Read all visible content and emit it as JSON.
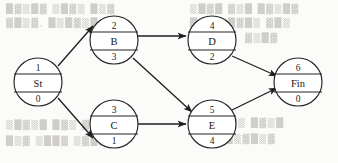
{
  "diagram": {
    "type": "activity-on-node-network",
    "node_fields": {
      "top": "node number",
      "middle": "activity label",
      "bottom": "duration"
    },
    "nodes": [
      {
        "id": "n1",
        "number": "1",
        "label": "St",
        "duration": "0",
        "cx": 38,
        "cy": 82
      },
      {
        "id": "n2",
        "number": "2",
        "label": "B",
        "duration": "3",
        "cx": 114,
        "cy": 40
      },
      {
        "id": "n3",
        "number": "3",
        "label": "C",
        "duration": "1",
        "cx": 114,
        "cy": 124
      },
      {
        "id": "n4",
        "number": "4",
        "label": "D",
        "duration": "2",
        "cx": 212,
        "cy": 40
      },
      {
        "id": "n5",
        "number": "5",
        "label": "E",
        "duration": "4",
        "cx": 212,
        "cy": 124
      },
      {
        "id": "n6",
        "number": "6",
        "label": "Fin",
        "duration": "0",
        "cx": 298,
        "cy": 82
      }
    ],
    "edges": [
      {
        "id": "e1",
        "from": "n1",
        "to": "n2",
        "name": "edge-st-to-b"
      },
      {
        "id": "e2",
        "from": "n1",
        "to": "n3",
        "name": "edge-st-to-c"
      },
      {
        "id": "e3",
        "from": "n2",
        "to": "n4",
        "name": "edge-b-to-d"
      },
      {
        "id": "e4",
        "from": "n2",
        "to": "n5",
        "name": "edge-b-to-e"
      },
      {
        "id": "e5",
        "from": "n3",
        "to": "n5",
        "name": "edge-c-to-e"
      },
      {
        "id": "e6",
        "from": "n4",
        "to": "n6",
        "name": "edge-d-to-fin"
      },
      {
        "id": "e7",
        "from": "n5",
        "to": "n6",
        "name": "edge-e-to-fin"
      }
    ],
    "background_showthrough": [
      "█▓▒█▓ ▒█▓▒ █▒▓",
      "▓█▒▓, █▒█▓▒█ ▒▓",
      "▒█▓█ ▓▒█ █▓▒█▓",
      "█▓▒ ▒█▓█▒ ▓█▒",
      "▓▒█▓",
      "▒█▓▒█ █▓▒ ▓█▒█▓",
      "█▒▓ ▒██▓ ▒▓█▒",
      "▓▒█▓█▒ █▓▒█",
      "▒█▓ █▒▓█▒▓"
    ],
    "colors": {
      "page": "#fbfbfa",
      "ink": "#1f1f1f",
      "showthrough": "#c9c7c2"
    }
  }
}
